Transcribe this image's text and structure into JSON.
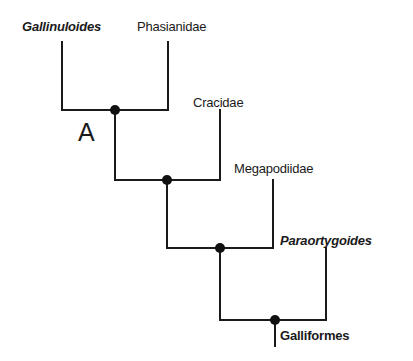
{
  "diagram": {
    "type": "cladogram",
    "panel_label": "A",
    "taxa": [
      {
        "name": "Gallinuloides",
        "style": "bold-italic",
        "kind": "fossil"
      },
      {
        "name": "Phasianidae",
        "style": "regular",
        "kind": "extant"
      },
      {
        "name": "Cracidae",
        "style": "regular",
        "kind": "extant"
      },
      {
        "name": "Megapodiidae",
        "style": "regular",
        "kind": "extant"
      },
      {
        "name": "Paraortygoides",
        "style": "bold-italic",
        "kind": "fossil"
      }
    ],
    "root_label": {
      "name": "Galliformes",
      "style": "bold"
    },
    "topology": "(((((Gallinuloides,Phasianidae),Cracidae),Megapodiidae),Paraortygoides))Galliformes",
    "nodes": 4,
    "line_color": "#1a1a1a",
    "background_color": "#ffffff"
  }
}
